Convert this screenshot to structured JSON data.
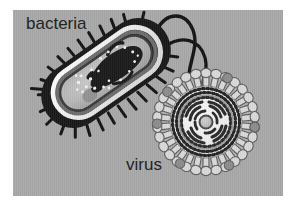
{
  "figure": {
    "frame_color": "#ffffff",
    "panel_background_color": "#a9a9a9",
    "panel_rect": {
      "x": 13,
      "y": 10,
      "width": 270,
      "height": 186
    }
  },
  "labels": {
    "bacteria": "bacteria",
    "virus": "virus",
    "text_color": "#242424"
  },
  "bacteria": {
    "name": "bacteria-cell-cutaway",
    "shape": "rod / capsule (bacillus)",
    "orientation_deg": -35,
    "colors": {
      "outer_membrane": "#191919",
      "cell_wall_band": "#efefef",
      "periplasm_band": "#6a6a6a",
      "inner_membrane": "#3c3c3c",
      "cytoplasm": "#b9b9b9",
      "nucleoid_dna": "#1b1b1b",
      "ribosomes": "#f2f2f2",
      "inclusion_body": "#8d8d8d",
      "pili": "#141414",
      "flagella": "#141414"
    },
    "parts": [
      {
        "name": "outer-membrane",
        "label": "outer membrane"
      },
      {
        "name": "cell-wall",
        "label": "cell wall"
      },
      {
        "name": "plasma-membrane",
        "label": "plasma membrane"
      },
      {
        "name": "cytoplasm",
        "label": "cytoplasm"
      },
      {
        "name": "nucleoid",
        "label": "nucleoid (DNA)"
      },
      {
        "name": "ribosomes",
        "label": "ribosomes"
      },
      {
        "name": "pili",
        "label": "pili"
      },
      {
        "name": "flagella",
        "label": "flagella"
      }
    ],
    "counts": {
      "pili": 26,
      "flagella": 2,
      "ribosome_dots": 22
    }
  },
  "virus": {
    "name": "enveloped-virus-cross-section",
    "shape": "spherical, spiked envelope",
    "center": {
      "x": 206,
      "y": 122
    },
    "radius_px": 48,
    "colors": {
      "spike_fill": "#d8d8d8",
      "spike_outline": "#5a5a5a",
      "envelope_fill": "#f0f0f0",
      "bilayer_dots": "#242424",
      "matrix_ring": "#9a9a9a",
      "rna_segments": "#2a2a2a",
      "core_fill": "#bdbdbd",
      "accent_knob": "#8a8a8a"
    },
    "parts": [
      {
        "name": "glycoprotein-spikes",
        "label": "glycoprotein spikes"
      },
      {
        "name": "lipid-envelope",
        "label": "lipid envelope"
      },
      {
        "name": "matrix-protein",
        "label": "matrix protein"
      },
      {
        "name": "nucleocapsid-rna",
        "label": "nucleocapsid / RNA"
      },
      {
        "name": "core",
        "label": "core"
      }
    ],
    "counts": {
      "spikes": 30,
      "rna_arcs": 12
    }
  }
}
